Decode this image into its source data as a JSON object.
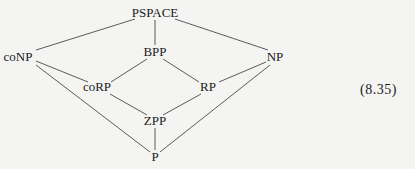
{
  "diagram": {
    "nodes": [
      {
        "id": "PSPACE",
        "label": "PSPACE",
        "x": 155,
        "y": 13
      },
      {
        "id": "coNP",
        "label": "coNP",
        "x": 18,
        "y": 57
      },
      {
        "id": "BPP",
        "label": "BPP",
        "x": 155,
        "y": 52
      },
      {
        "id": "NP",
        "label": "NP",
        "x": 275,
        "y": 57
      },
      {
        "id": "coRP",
        "label": "coRP",
        "x": 97,
        "y": 87
      },
      {
        "id": "RP",
        "label": "RP",
        "x": 207,
        "y": 87
      },
      {
        "id": "ZPP",
        "label": "ZPP",
        "x": 155,
        "y": 121
      },
      {
        "id": "P",
        "label": "P",
        "x": 155,
        "y": 157
      }
    ],
    "edges": [
      [
        "PSPACE",
        "coNP"
      ],
      [
        "PSPACE",
        "BPP"
      ],
      [
        "PSPACE",
        "NP"
      ],
      [
        "coNP",
        "coRP"
      ],
      [
        "coNP",
        "P"
      ],
      [
        "BPP",
        "coRP"
      ],
      [
        "BPP",
        "RP"
      ],
      [
        "NP",
        "RP"
      ],
      [
        "NP",
        "P"
      ],
      [
        "coRP",
        "ZPP"
      ],
      [
        "RP",
        "ZPP"
      ],
      [
        "ZPP",
        "P"
      ]
    ],
    "equation_number": "(8.35)",
    "line_color": "#4a4a4a"
  }
}
